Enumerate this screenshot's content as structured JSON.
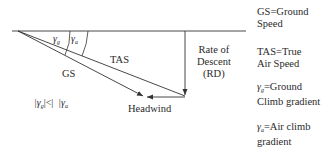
{
  "diagram": {
    "labels": {
      "tas": "TAS",
      "gs": "GS",
      "headwind": "Headwind",
      "rd_line1": "Rate of",
      "rd_line2": "Descent",
      "rd_line3": "(RD)",
      "gamma": "γ",
      "gamma_g_sub": "g",
      "gamma_a_sub": "a",
      "inequality_left": "|γ",
      "inequality_sub_g": "g",
      "inequality_mid": "|<|",
      "inequality_right": "|γ",
      "inequality_sub_a": "a"
    },
    "legend": [
      {
        "line1": "GS=Ground",
        "line2": "Speed"
      },
      {
        "line1": "TAS=True",
        "line2": "Air Speed"
      },
      {
        "symbol": "γ",
        "sub": "g",
        "line1": "=Ground",
        "line2": "Climb gradient"
      },
      {
        "symbol": "γ",
        "sub": "a",
        "line1": "=Air climb",
        "line2": "gradient"
      }
    ],
    "colors": {
      "line": "#333333",
      "text": "#2a2a2a",
      "background": "#ffffff"
    }
  }
}
